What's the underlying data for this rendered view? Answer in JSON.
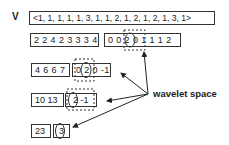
{
  "vector": {
    "label": "V",
    "values": "<1, 1, 1, 1, 1, 3, 1, 1, 2, 1, 2, 1, 2, 1, 3, 1>"
  },
  "levels": [
    {
      "averages": "2 2 4 2 3 3 3 4",
      "details": "0 0 2 0 1 1 1 2",
      "highlight": "2"
    },
    {
      "averages": "4 6 6 7",
      "details": "0 2 0 -1",
      "highlight": "2"
    },
    {
      "averages": "10 13",
      "details": "2 -1",
      "highlight": "2"
    },
    {
      "averages": "23",
      "details": "3",
      "highlight": "3"
    }
  ],
  "annotation": {
    "label": "wavelet space",
    "color": "#222222"
  }
}
